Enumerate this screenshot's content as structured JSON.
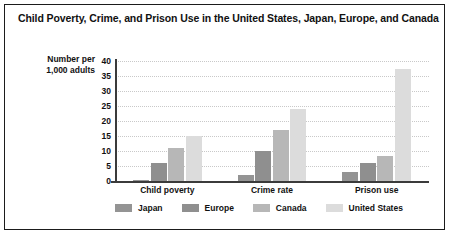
{
  "chart_data": {
    "type": "bar",
    "title": "Child Poverty, Crime, and Prison Use in the United States, Japan, Europe, and Canada",
    "xlabel": "",
    "ylabel": "Number per 1,000 adults",
    "ylabel_lines": [
      "Number per",
      "1,000 adults"
    ],
    "categories": [
      "Child poverty",
      "Crime rate",
      "Prison use"
    ],
    "series": [
      {
        "name": "Japan",
        "color": "#949494",
        "values": [
          0.5,
          2,
          3
        ]
      },
      {
        "name": "Europe",
        "color": "#8f8f8f",
        "values": [
          6,
          10,
          6
        ]
      },
      {
        "name": "Canada",
        "color": "#b7b7b7",
        "values": [
          11,
          17,
          8.5
        ]
      },
      {
        "name": "United States",
        "color": "#dcdcdc",
        "values": [
          15,
          24,
          37.5
        ]
      }
    ],
    "ylim": [
      0,
      40
    ],
    "yticks": [
      40,
      35,
      30,
      25,
      20,
      15,
      10,
      5,
      0
    ],
    "grid": true,
    "legend_position": "bottom"
  }
}
